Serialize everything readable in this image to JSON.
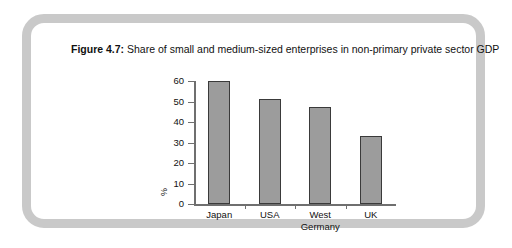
{
  "figure": {
    "label": "Figure 4.7:",
    "caption": "Share of small and medium-sized enterprises in non-primary private sector GDP"
  },
  "colors": {
    "frame": "#c9c9c9",
    "bar_fill": "#9c9c9c",
    "bar_stroke": "#3a3a3a",
    "axis": "#6f6f6f",
    "text": "#111111",
    "background": "#ffffff"
  },
  "chart_data": {
    "type": "bar",
    "title": "Share of small and medium-sized enterprises in non-primary private sector GDP",
    "categories": [
      "Japan",
      "USA",
      "West\nGermany",
      "UK"
    ],
    "values": [
      60,
      51,
      47.5,
      33
    ],
    "xlabel": "",
    "ylabel": "%",
    "ylim": [
      0,
      60
    ],
    "yticks": [
      0,
      10,
      20,
      30,
      40,
      50,
      60
    ],
    "ytick_labels": [
      "0",
      "10",
      "20",
      "30",
      "40",
      "50",
      "60"
    ],
    "grid": false,
    "legend": false
  }
}
